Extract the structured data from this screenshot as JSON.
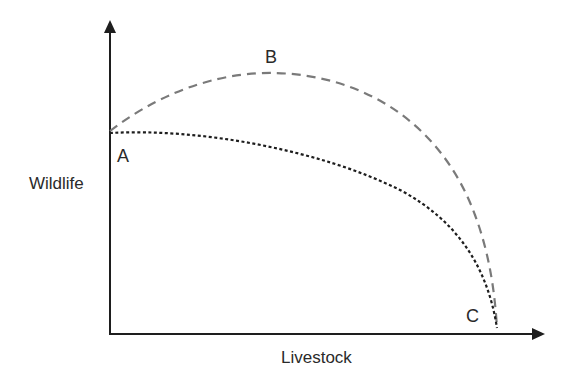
{
  "diagram": {
    "type": "production-possibility-frontier",
    "axes": {
      "y_label": "Wildlife",
      "x_label": "Livestock"
    },
    "points": {
      "a": "A",
      "b": "B",
      "c": "C"
    },
    "curves": [
      {
        "name": "complementary-frontier",
        "style": "dashed",
        "color": "#7a7a7a",
        "from": "A",
        "through": "B",
        "to": "C"
      },
      {
        "name": "competitive-frontier",
        "style": "dotted",
        "color": "#1e1e1e",
        "from": "A",
        "to": "C"
      }
    ],
    "colors": {
      "axis": "#1e1e1e",
      "dashed_curve": "#7a7a7a",
      "dotted_curve": "#1e1e1e",
      "text": "#2a2a2a"
    }
  }
}
